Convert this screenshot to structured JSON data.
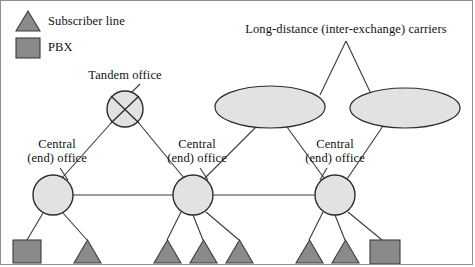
{
  "figure": {
    "background_color": "#ffffff",
    "border_color": "#8e8e8e",
    "shape_fill": "#e2e2e2",
    "shape_stroke": "#2b2b2b",
    "symbol_fill": "#8a8a8a",
    "symbol_stroke": "#3d3d3d",
    "line_color": "#3a3a3a"
  },
  "legend": {
    "items": [
      {
        "symbol": "triangle",
        "label": "Subscriber line"
      },
      {
        "symbol": "square",
        "label": "PBX"
      }
    ]
  },
  "labels": {
    "tandem_office": "Tandem office",
    "long_distance": "Long-distance (inter-exchange) carriers",
    "central_office_line1": "Central",
    "central_office_line2": "(end) office"
  },
  "nodes": {
    "tandem": {
      "name": "Tandem office",
      "cx": 125,
      "cy": 109,
      "r": 18
    },
    "central_offices": [
      {
        "name": "Central (end) office",
        "cx": 53,
        "cy": 195,
        "r": 20
      },
      {
        "name": "Central (end) office",
        "cx": 193,
        "cy": 195,
        "r": 20
      },
      {
        "name": "Central (end) office",
        "cx": 335,
        "cy": 195,
        "r": 20
      }
    ],
    "carriers": [
      {
        "name": "Long-distance carrier cloud",
        "cx": 270,
        "cy": 107,
        "rx": 55,
        "ry": 21
      },
      {
        "name": "Long-distance carrier cloud",
        "cx": 405,
        "cy": 108,
        "rx": 55,
        "ry": 20
      }
    ],
    "terminals": [
      {
        "type": "square",
        "name": "PBX",
        "x": 13,
        "y": 240,
        "w": 28,
        "h": 23
      },
      {
        "type": "triangle",
        "name": "Subscriber line",
        "x": 74,
        "y": 240,
        "w": 27,
        "h": 23
      },
      {
        "type": "triangle",
        "name": "Subscriber line",
        "x": 154,
        "y": 240,
        "w": 27,
        "h": 23
      },
      {
        "type": "triangle",
        "name": "Subscriber line",
        "x": 190,
        "y": 240,
        "w": 27,
        "h": 23
      },
      {
        "type": "triangle",
        "name": "Subscriber line",
        "x": 226,
        "y": 240,
        "w": 27,
        "h": 23
      },
      {
        "type": "triangle",
        "name": "Subscriber line",
        "x": 296,
        "y": 240,
        "w": 27,
        "h": 23
      },
      {
        "type": "triangle",
        "name": "Subscriber line",
        "x": 332,
        "y": 240,
        "w": 27,
        "h": 23
      },
      {
        "type": "square",
        "name": "PBX",
        "x": 370,
        "y": 240,
        "w": 30,
        "h": 24
      }
    ]
  }
}
